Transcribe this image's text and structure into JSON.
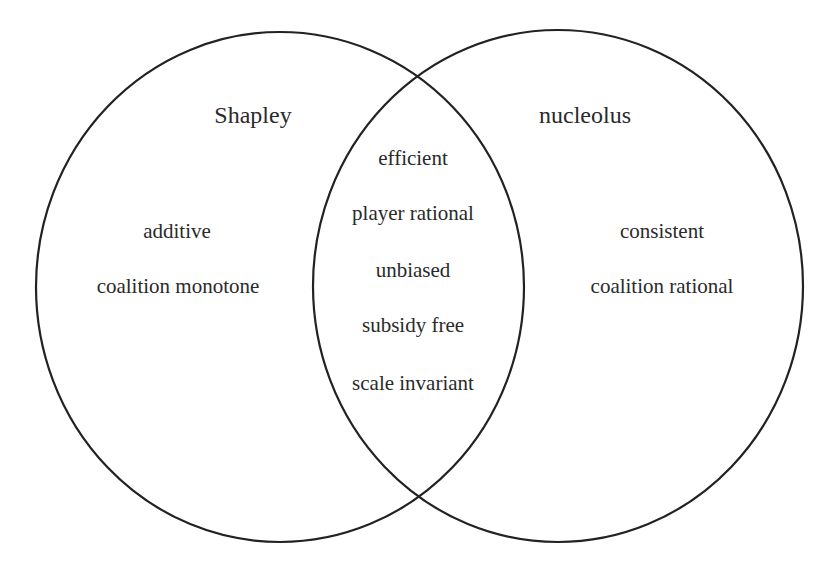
{
  "diagram": {
    "type": "venn",
    "sets": [
      {
        "name": "Shapley",
        "exclusive_properties": [
          "additive",
          "coalition monotone"
        ]
      },
      {
        "name": "nucleolus",
        "exclusive_properties": [
          "consistent",
          "coalition rational"
        ]
      }
    ],
    "intersection": {
      "properties": [
        "efficient",
        "player rational",
        "unbiased",
        "subsidy free",
        "scale invariant"
      ]
    },
    "colors": {
      "stroke": "#222222",
      "text": "#2a2a2a",
      "background": "#ffffff"
    }
  }
}
